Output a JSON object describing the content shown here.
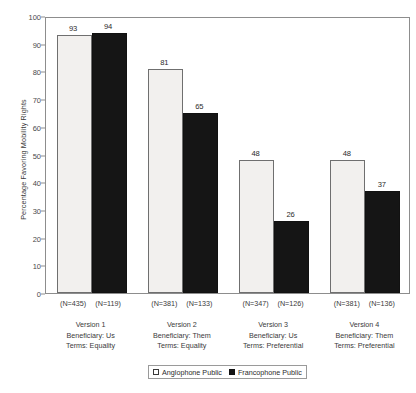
{
  "chart_data": {
    "type": "bar",
    "title": "",
    "xlabel": "",
    "ylabel": "Percentage Favoring Mobility Rights",
    "ylim": [
      0,
      100
    ],
    "ytick_labels": [
      "0",
      "10",
      "20",
      "30",
      "40",
      "50",
      "60",
      "70",
      "80",
      "90",
      "100"
    ],
    "ytick_values": [
      0,
      10,
      20,
      30,
      40,
      50,
      60,
      70,
      80,
      90,
      100
    ],
    "grid": false,
    "legend_position": "bottom-center",
    "categories": [
      "Version 1\nBeneficiary: Us\nTerms: Equality",
      "Version 2\nBeneficiary: Them\nTerms: Equality",
      "Version 3\nBeneficiary: Us\nTerms: Preferential",
      "Version 4\nBeneficiary: Them\nTerms: Preferential"
    ],
    "series": [
      {
        "name": "Anglophone Public",
        "values": [
          93,
          81,
          48,
          48
        ],
        "color": "#f2f0ee"
      },
      {
        "name": "Francophone Public",
        "values": [
          94,
          65,
          26,
          37
        ],
        "color": "#151515"
      }
    ],
    "groups": [
      {
        "version_label": "Version 1",
        "beneficiary_label": "Beneficiary: Us",
        "terms_label": "Terms: Equality",
        "bars": [
          {
            "series": "Anglophone Public",
            "value": 93,
            "value_label": "93",
            "n_label": "(N=435)"
          },
          {
            "series": "Francophone Public",
            "value": 94,
            "value_label": "94",
            "n_label": "(N=119)"
          }
        ]
      },
      {
        "version_label": "Version 2",
        "beneficiary_label": "Beneficiary: Them",
        "terms_label": "Terms: Equality",
        "bars": [
          {
            "series": "Anglophone Public",
            "value": 81,
            "value_label": "81",
            "n_label": "(N=381)"
          },
          {
            "series": "Francophone Public",
            "value": 65,
            "value_label": "65",
            "n_label": "(N=133)"
          }
        ]
      },
      {
        "version_label": "Version 3",
        "beneficiary_label": "Beneficiary: Us",
        "terms_label": "Terms: Preferential",
        "bars": [
          {
            "series": "Anglophone Public",
            "value": 48,
            "value_label": "48",
            "n_label": "(N=347)"
          },
          {
            "series": "Francophone Public",
            "value": 26,
            "value_label": "26",
            "n_label": "(N=126)"
          }
        ]
      },
      {
        "version_label": "Version 4",
        "beneficiary_label": "Beneficiary: Them",
        "terms_label": "Terms: Preferential",
        "bars": [
          {
            "series": "Anglophone Public",
            "value": 48,
            "value_label": "48",
            "n_label": "(N=381)"
          },
          {
            "series": "Francophone Public",
            "value": 37,
            "value_label": "37",
            "n_label": "(N=136)"
          }
        ]
      }
    ],
    "legend": [
      {
        "label": "Anglophone Public",
        "swatch": "light"
      },
      {
        "label": "Francophone Public",
        "swatch": "dark"
      }
    ]
  }
}
